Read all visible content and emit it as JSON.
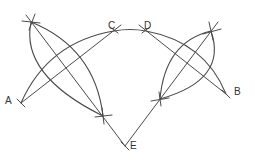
{
  "diagram": {
    "type": "geometric-construction",
    "stroke_color": "#4a4a4a",
    "label_color": "#333333",
    "points": [
      {
        "id": "A",
        "label": "A",
        "x": 21,
        "y": 103,
        "label_x": 5,
        "label_y": 96
      },
      {
        "id": "B",
        "label": "B",
        "x": 226,
        "y": 94,
        "label_x": 234,
        "label_y": 87
      },
      {
        "id": "C",
        "label": "C",
        "x": 114,
        "y": 30,
        "label_x": 108,
        "label_y": 21
      },
      {
        "id": "D",
        "label": "D",
        "x": 146,
        "y": 30,
        "label_x": 144,
        "label_y": 21
      },
      {
        "id": "E",
        "label": "E",
        "x": 125,
        "y": 146,
        "label_x": 130,
        "label_y": 141
      }
    ],
    "construction_points": [
      {
        "id": "P1",
        "x": 31,
        "y": 22
      },
      {
        "id": "P2",
        "x": 103,
        "y": 116
      },
      {
        "id": "P3",
        "x": 211,
        "y": 31
      },
      {
        "id": "P4",
        "x": 160,
        "y": 99
      }
    ],
    "segments": [
      {
        "from": "A",
        "to": "C"
      },
      {
        "from": "D",
        "to": "B"
      },
      {
        "from": "P1",
        "to": "E"
      },
      {
        "from": "E",
        "to": "P3"
      }
    ],
    "arcs": [
      {
        "name": "main-arc",
        "through": [
          "A",
          "C",
          "D",
          "B"
        ]
      },
      {
        "name": "left-lens-outer",
        "through": [
          "P1",
          "P2"
        ]
      },
      {
        "name": "left-lens-inner",
        "through": [
          "P1",
          "P2"
        ]
      },
      {
        "name": "right-lens-outer",
        "through": [
          "P3",
          "P4"
        ]
      },
      {
        "name": "right-lens-inner",
        "through": [
          "P3",
          "P4"
        ]
      }
    ]
  }
}
